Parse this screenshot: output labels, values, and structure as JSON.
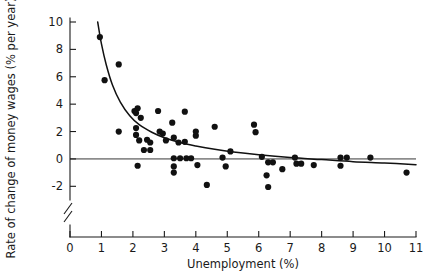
{
  "chart_data": {
    "type": "scatter",
    "title": "",
    "xlabel": "Unemployment (%)",
    "ylabel": "Rate of change of money wages (% per year)",
    "xlim": [
      0,
      11
    ],
    "ylim": [
      -3,
      10
    ],
    "xticks": [
      0,
      1,
      2,
      3,
      4,
      5,
      6,
      7,
      8,
      9,
      10,
      11
    ],
    "xtick_labels": [
      "0",
      "1",
      "2",
      "3",
      "4",
      "5",
      "6",
      "7",
      "8",
      "9",
      "10",
      "11"
    ],
    "yticks": [
      -2,
      0,
      2,
      4,
      6,
      8,
      10
    ],
    "ytick_labels": [
      "-2",
      "0",
      "2",
      "4",
      "6",
      "8",
      "10"
    ],
    "grid": false,
    "legend": null,
    "y_axis_break": true,
    "zero_reference_line": {
      "y": 0,
      "color": "#8c8c8c"
    },
    "point_color": "#111111",
    "curve_color": "#111111",
    "points": [
      {
        "x": 0.95,
        "y": 8.9
      },
      {
        "x": 1.1,
        "y": 5.75
      },
      {
        "x": 1.55,
        "y": 6.9
      },
      {
        "x": 1.55,
        "y": 2.0
      },
      {
        "x": 2.05,
        "y": 3.5
      },
      {
        "x": 2.1,
        "y": 3.35
      },
      {
        "x": 2.1,
        "y": 2.25
      },
      {
        "x": 2.1,
        "y": 1.75
      },
      {
        "x": 2.15,
        "y": 3.7
      },
      {
        "x": 2.25,
        "y": 3.0
      },
      {
        "x": 2.2,
        "y": 1.35
      },
      {
        "x": 2.15,
        "y": -0.5
      },
      {
        "x": 2.35,
        "y": 0.65
      },
      {
        "x": 2.45,
        "y": 1.4
      },
      {
        "x": 2.55,
        "y": 1.2
      },
      {
        "x": 2.55,
        "y": 0.65
      },
      {
        "x": 2.8,
        "y": 3.5
      },
      {
        "x": 2.85,
        "y": 2.0
      },
      {
        "x": 2.95,
        "y": 1.85
      },
      {
        "x": 3.05,
        "y": 1.35
      },
      {
        "x": 3.25,
        "y": 2.65
      },
      {
        "x": 3.3,
        "y": 1.55
      },
      {
        "x": 3.3,
        "y": 0.05
      },
      {
        "x": 3.3,
        "y": -0.55
      },
      {
        "x": 3.3,
        "y": -1.0
      },
      {
        "x": 3.45,
        "y": 1.2
      },
      {
        "x": 3.5,
        "y": 0.05
      },
      {
        "x": 3.65,
        "y": 3.45
      },
      {
        "x": 3.65,
        "y": 1.25
      },
      {
        "x": 3.7,
        "y": 0.05
      },
      {
        "x": 3.85,
        "y": 0.05
      },
      {
        "x": 4.0,
        "y": 1.7
      },
      {
        "x": 4.0,
        "y": 2.0
      },
      {
        "x": 4.05,
        "y": -0.45
      },
      {
        "x": 4.35,
        "y": -1.9
      },
      {
        "x": 4.6,
        "y": 2.35
      },
      {
        "x": 4.85,
        "y": 0.1
      },
      {
        "x": 4.95,
        "y": -0.55
      },
      {
        "x": 5.1,
        "y": 0.55
      },
      {
        "x": 5.85,
        "y": 2.5
      },
      {
        "x": 5.9,
        "y": 1.95
      },
      {
        "x": 6.1,
        "y": 0.15
      },
      {
        "x": 6.25,
        "y": -1.2
      },
      {
        "x": 6.3,
        "y": -2.05
      },
      {
        "x": 6.3,
        "y": -0.25
      },
      {
        "x": 6.45,
        "y": -0.25
      },
      {
        "x": 6.75,
        "y": -0.75
      },
      {
        "x": 7.15,
        "y": 0.1
      },
      {
        "x": 7.2,
        "y": -0.35
      },
      {
        "x": 7.35,
        "y": -0.35
      },
      {
        "x": 7.75,
        "y": -0.45
      },
      {
        "x": 8.6,
        "y": 0.1
      },
      {
        "x": 8.6,
        "y": -0.5
      },
      {
        "x": 8.8,
        "y": 0.1
      },
      {
        "x": 9.55,
        "y": 0.1
      },
      {
        "x": 10.7,
        "y": -1.0
      }
    ],
    "fit_curve_description": "Downward-sloping Phillips curve fitted through the scatter",
    "fit_curve_points": [
      {
        "x": 0.88,
        "y": 10.0
      },
      {
        "x": 1.0,
        "y": 8.4
      },
      {
        "x": 1.15,
        "y": 6.9
      },
      {
        "x": 1.35,
        "y": 5.4
      },
      {
        "x": 1.6,
        "y": 4.15
      },
      {
        "x": 1.9,
        "y": 3.15
      },
      {
        "x": 2.2,
        "y": 2.5
      },
      {
        "x": 2.6,
        "y": 1.95
      },
      {
        "x": 3.0,
        "y": 1.55
      },
      {
        "x": 3.5,
        "y": 1.2
      },
      {
        "x": 4.0,
        "y": 0.95
      },
      {
        "x": 4.6,
        "y": 0.7
      },
      {
        "x": 5.2,
        "y": 0.5
      },
      {
        "x": 6.0,
        "y": 0.3
      },
      {
        "x": 7.0,
        "y": 0.1
      },
      {
        "x": 8.0,
        "y": -0.05
      },
      {
        "x": 9.0,
        "y": -0.2
      },
      {
        "x": 10.0,
        "y": -0.3
      },
      {
        "x": 11.0,
        "y": -0.42
      }
    ]
  },
  "axis": {
    "x_title": "Unemployment (%)",
    "y_title": "Rate of change of money wages (% per year)"
  }
}
